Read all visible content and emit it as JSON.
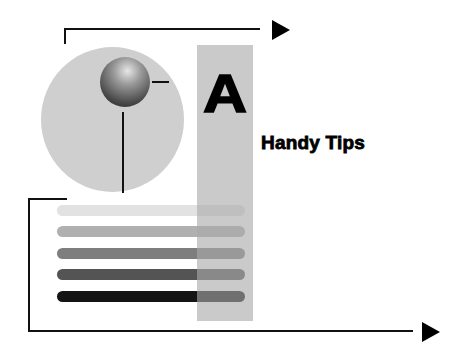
{
  "section": {
    "letter": "A",
    "title": "Handy Tips"
  },
  "illustration": {
    "icon": "pushpin-icon",
    "bars": [
      {
        "color": "#e2e2e2",
        "top": 205
      },
      {
        "color": "#b0b0b0",
        "top": 226
      },
      {
        "color": "#7e7e7e",
        "top": 248
      },
      {
        "color": "#545454",
        "top": 269
      },
      {
        "color": "#141414",
        "top": 291
      }
    ]
  },
  "colors": {
    "circle": "#cfcfcf",
    "column": "#b8b8b8",
    "ink": "#000000"
  }
}
